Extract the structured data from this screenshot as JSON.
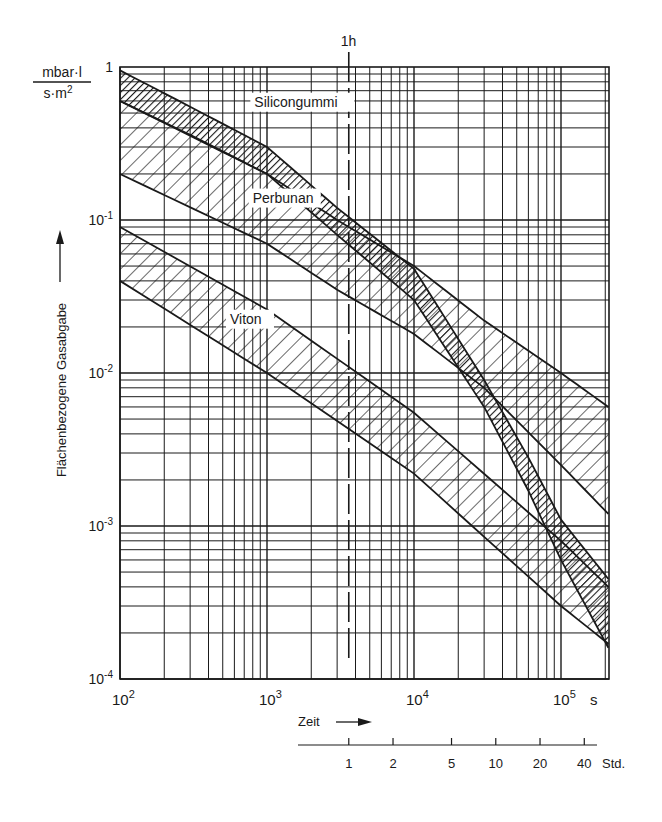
{
  "chart_data": {
    "type": "area",
    "title": "",
    "xlabel": "Zeit",
    "ylabel": "Flächenbezogene Gasabgabe",
    "y_unit": {
      "numerator": "mbar·l",
      "denominator": "s·m²"
    },
    "x_unit": "s",
    "x_scale": "log",
    "y_scale": "log",
    "xlim": [
      100,
      210000
    ],
    "ylim": [
      0.0001,
      1
    ],
    "grid": true,
    "x_ticks": [
      {
        "value": 100,
        "base": "10",
        "exp": "2"
      },
      {
        "value": 1000,
        "base": "10",
        "exp": "3"
      },
      {
        "value": 10000,
        "base": "10",
        "exp": "4"
      },
      {
        "value": 100000,
        "base": "10",
        "exp": "5"
      }
    ],
    "y_ticks": [
      {
        "value": 1,
        "base": "1",
        "exp": ""
      },
      {
        "value": 0.1,
        "base": "10",
        "exp": "-1"
      },
      {
        "value": 0.01,
        "base": "10",
        "exp": "-2"
      },
      {
        "value": 0.001,
        "base": "10",
        "exp": "-3"
      },
      {
        "value": 0.0001,
        "base": "10",
        "exp": "-4"
      }
    ],
    "marker": {
      "label": "1h",
      "x": 3600,
      "style": "dashed"
    },
    "secondary_x_axis": {
      "unit": "Std.",
      "ticks": [
        {
          "label": "1",
          "hours": 1
        },
        {
          "label": "2",
          "hours": 2
        },
        {
          "label": "5",
          "hours": 5
        },
        {
          "label": "10",
          "hours": 10
        },
        {
          "label": "20",
          "hours": 20
        },
        {
          "label": "40",
          "hours": 40
        }
      ]
    },
    "series": [
      {
        "name": "Silicongummi",
        "hatch": "dense",
        "upper": [
          [
            100,
            0.95
          ],
          [
            300,
            0.55
          ],
          [
            1000,
            0.3
          ],
          [
            3000,
            0.12
          ],
          [
            10000,
            0.048
          ],
          [
            30000,
            0.009
          ],
          [
            60000,
            0.0028
          ],
          [
            100000,
            0.0011
          ],
          [
            210000,
            0.00045
          ]
        ],
        "lower": [
          [
            100,
            0.6
          ],
          [
            300,
            0.36
          ],
          [
            1000,
            0.2
          ],
          [
            3000,
            0.08
          ],
          [
            10000,
            0.03
          ],
          [
            30000,
            0.006
          ],
          [
            60000,
            0.0017
          ],
          [
            100000,
            0.0006
          ],
          [
            210000,
            0.00016
          ]
        ],
        "label_pos": [
          820,
          0.55
        ]
      },
      {
        "name": "Perbunan",
        "hatch": "sparse",
        "upper": [
          [
            100,
            0.6
          ],
          [
            1000,
            0.2
          ],
          [
            3000,
            0.1
          ],
          [
            10000,
            0.05
          ],
          [
            30000,
            0.022
          ],
          [
            100000,
            0.01
          ],
          [
            210000,
            0.006
          ]
        ],
        "lower": [
          [
            100,
            0.2
          ],
          [
            1000,
            0.07
          ],
          [
            3000,
            0.035
          ],
          [
            10000,
            0.018
          ],
          [
            30000,
            0.008
          ],
          [
            100000,
            0.0025
          ],
          [
            210000,
            0.0012
          ]
        ],
        "label_pos": [
          800,
          0.13
        ]
      },
      {
        "name": "Viton",
        "hatch": "sparse",
        "upper": [
          [
            100,
            0.09
          ],
          [
            1000,
            0.026
          ],
          [
            10000,
            0.0055
          ],
          [
            100000,
            0.0008
          ],
          [
            210000,
            0.0004
          ]
        ],
        "lower": [
          [
            100,
            0.04
          ],
          [
            1000,
            0.01
          ],
          [
            10000,
            0.0022
          ],
          [
            100000,
            0.0003
          ],
          [
            210000,
            0.00017
          ]
        ],
        "label_pos": [
          560,
          0.021
        ]
      }
    ]
  },
  "labels": {
    "y_unit_num": "mbar·l",
    "y_unit_den": "s·m",
    "y_unit_den_sup": "2",
    "y_axis_title": "Flächenbezogene Gasabgabe",
    "x_axis_title": "Zeit",
    "x_unit": "s",
    "hour_marker": "1h",
    "std_unit": "Std."
  }
}
